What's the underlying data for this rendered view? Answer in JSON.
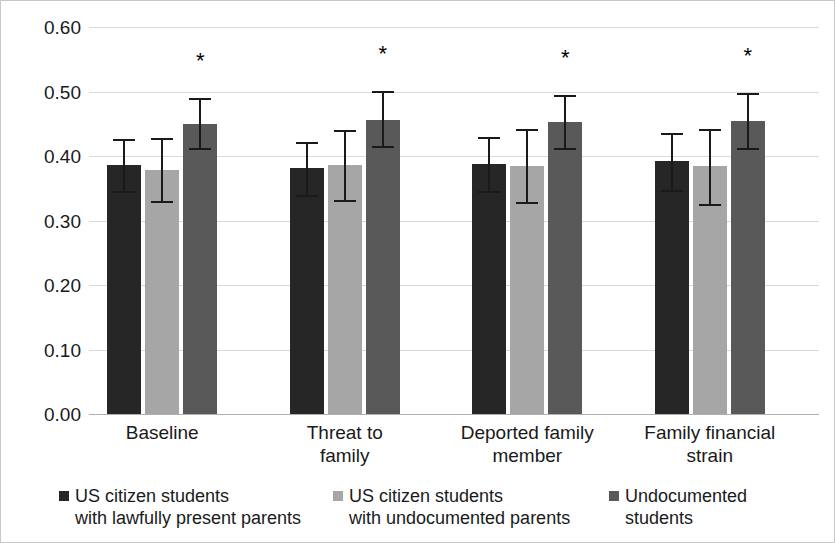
{
  "chart_data": {
    "type": "bar",
    "title": "",
    "xlabel": "",
    "ylabel": "",
    "ylim": [
      0.0,
      0.6
    ],
    "ytick_labels": [
      "0.00",
      "0.10",
      "0.20",
      "0.30",
      "0.40",
      "0.50",
      "0.60"
    ],
    "ytick_values": [
      0.0,
      0.1,
      0.2,
      0.3,
      0.4,
      0.5,
      0.6
    ],
    "grid": true,
    "legend_position": "bottom",
    "categories": [
      "Baseline",
      "Threat to family",
      "Deported family member",
      "Family financial strain"
    ],
    "category_lines": [
      [
        "Baseline"
      ],
      [
        "Threat to",
        "family"
      ],
      [
        "Deported family",
        "member"
      ],
      [
        "Family financial",
        "strain"
      ]
    ],
    "series": [
      {
        "name": "US citizen students with lawfully present parents",
        "name_lines": [
          "US citizen students",
          "with lawfully present parents"
        ],
        "color": "#262626",
        "values": [
          0.386,
          0.381,
          0.388,
          0.392
        ],
        "err_low": [
          0.345,
          0.34,
          0.345,
          0.348
        ],
        "err_high": [
          0.427,
          0.422,
          0.43,
          0.436
        ],
        "significance": [
          "",
          "",
          "",
          ""
        ]
      },
      {
        "name": "US citizen students with undocumented parents",
        "name_lines": [
          "US citizen students",
          "with undocumented parents"
        ],
        "color": "#a6a6a6",
        "values": [
          0.379,
          0.386,
          0.385,
          0.384
        ],
        "err_low": [
          0.33,
          0.332,
          0.328,
          0.326
        ],
        "err_high": [
          0.428,
          0.44,
          0.442,
          0.442
        ],
        "significance": [
          "",
          "",
          "",
          ""
        ]
      },
      {
        "name": "Undocumented students",
        "name_lines": [
          "Undocumented",
          "students"
        ],
        "color": "#595959",
        "values": [
          0.45,
          0.456,
          0.453,
          0.454
        ],
        "err_low": [
          0.412,
          0.415,
          0.413,
          0.413
        ],
        "err_high": [
          0.49,
          0.501,
          0.494,
          0.497
        ],
        "significance": [
          "*",
          "*",
          "*",
          "*"
        ]
      }
    ]
  },
  "legend": {
    "items": [
      {
        "swatch": "#262626",
        "line1": "US citizen students",
        "line2": "with lawfully present parents"
      },
      {
        "swatch": "#a6a6a6",
        "line1": "US citizen students",
        "line2": "with undocumented parents"
      },
      {
        "swatch": "#595959",
        "line1": "Undocumented",
        "line2": "students"
      }
    ]
  }
}
